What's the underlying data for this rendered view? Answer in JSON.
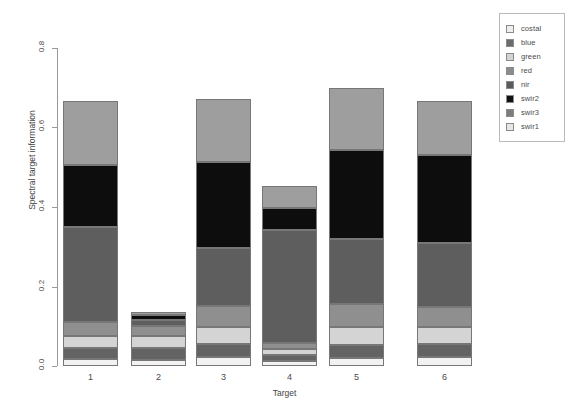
{
  "chart_data": {
    "type": "bar",
    "subtype": "stacked-bar",
    "title": "",
    "xlabel": "Target",
    "ylabel": "Spectral target information",
    "categories": [
      "1",
      "2",
      "3",
      "4",
      "5",
      "6"
    ],
    "xtick_labels": [
      "1",
      "2",
      "3",
      "4",
      "5",
      "6"
    ],
    "ytick_labels": [
      "0.0",
      "0.2",
      "0.4",
      "0.6",
      "0.8"
    ],
    "ytick_values": [
      0.0,
      0.2,
      0.4,
      0.6,
      0.8
    ],
    "ylim": [
      0.0,
      0.87
    ],
    "grid": false,
    "legend_position": "top-right",
    "stack_order_bottom_to_top": [
      "swir1",
      "swir3",
      "swir2",
      "nir",
      "red",
      "green",
      "blue",
      "costal"
    ],
    "series": [
      {
        "name": "swir1",
        "color": "#f2f2f2",
        "values": [
          0.018,
          0.016,
          0.022,
          0.012,
          0.02,
          0.022
        ]
      },
      {
        "name": "swir3",
        "color": "#636363",
        "values": [
          0.028,
          0.03,
          0.034,
          0.014,
          0.033,
          0.034
        ]
      },
      {
        "name": "swir2",
        "color": "#d4d4d4",
        "values": [
          0.03,
          0.032,
          0.044,
          0.016,
          0.046,
          0.042
        ]
      },
      {
        "name": "nir",
        "color": "#8f8f8f",
        "values": [
          0.036,
          0.026,
          0.052,
          0.014,
          0.058,
          0.05
        ]
      },
      {
        "name": "red",
        "color": "#5e5e5e",
        "values": [
          0.24,
          0.016,
          0.145,
          0.285,
          0.163,
          0.162
        ]
      },
      {
        "name": "green",
        "color": "#d9d9d9",
        "values": [
          0.0,
          0.0,
          0.0,
          0.0,
          0.0,
          0.0
        ]
      },
      {
        "name": "blue",
        "color": "#0d0d0d",
        "values": [
          0.157,
          0.011,
          0.216,
          0.056,
          0.223,
          0.22
        ]
      },
      {
        "name": "costal",
        "color": "#9e9e9e",
        "values": [
          0.161,
          0.006,
          0.158,
          0.057,
          0.156,
          0.135
        ]
      }
    ],
    "totals": [
      0.67,
      0.137,
      0.671,
      0.454,
      0.699,
      0.665
    ],
    "bar_totals_note": "Bar 3 total ~0.84, bar 5 ~0.86, bar 6 ~0.84 at top of plotted stack"
  },
  "legend": {
    "items": [
      {
        "label": "costal",
        "color": "#efefef"
      },
      {
        "label": "blue",
        "color": "#6b6b6b"
      },
      {
        "label": "green",
        "color": "#d3d3d3"
      },
      {
        "label": "red",
        "color": "#8c8c8c"
      },
      {
        "label": "nir",
        "color": "#5a5a5a"
      },
      {
        "label": "swir2",
        "color": "#121212"
      },
      {
        "label": "swir3",
        "color": "#7d7d7d"
      },
      {
        "label": "swir1",
        "color": "#e6e6e6"
      }
    ]
  },
  "axes": {
    "y_title": "Spectral target information",
    "x_title": "Target",
    "y_ticks": [
      "0.8",
      "0.6",
      "0.4",
      "0.2",
      "0.0"
    ],
    "x_ticks": [
      "1",
      "2",
      "3",
      "4",
      "5",
      "6"
    ]
  },
  "bars": [
    {
      "category": "1",
      "segments": [
        {
          "name": "swir1",
          "color": "#f2f2f2",
          "top": 359,
          "height": 7
        },
        {
          "name": "swir3",
          "color": "#636363",
          "top": 348,
          "height": 11
        },
        {
          "name": "swir2",
          "color": "#d4d4d4",
          "top": 336,
          "height": 12
        },
        {
          "name": "nir",
          "color": "#8f8f8f",
          "top": 322,
          "height": 14
        },
        {
          "name": "red",
          "color": "#5e5e5e",
          "top": 227,
          "height": 95
        },
        {
          "name": "swir2b",
          "color": "#0d0d0d",
          "top": 165,
          "height": 62
        },
        {
          "name": "costal",
          "color": "#9e9e9e",
          "top": 101,
          "height": 64
        }
      ]
    },
    {
      "category": "2",
      "segments": [
        {
          "name": "swir1",
          "color": "#f2f2f2",
          "top": 360,
          "height": 6
        },
        {
          "name": "swir3",
          "color": "#636363",
          "top": 348,
          "height": 12
        },
        {
          "name": "swir2",
          "color": "#d4d4d4",
          "top": 336,
          "height": 12
        },
        {
          "name": "nir",
          "color": "#8f8f8f",
          "top": 326,
          "height": 10
        },
        {
          "name": "red",
          "color": "#5e5e5e",
          "top": 320,
          "height": 6
        },
        {
          "name": "swir2b",
          "color": "#0d0d0d",
          "top": 315,
          "height": 5
        },
        {
          "name": "costal",
          "color": "#9e9e9e",
          "top": 312,
          "height": 3
        }
      ]
    },
    {
      "category": "3",
      "segments": [
        {
          "name": "swir1",
          "color": "#f2f2f2",
          "top": 357,
          "height": 9
        },
        {
          "name": "swir3",
          "color": "#636363",
          "top": 344,
          "height": 13
        },
        {
          "name": "swir2",
          "color": "#d4d4d4",
          "top": 327,
          "height": 17
        },
        {
          "name": "nir",
          "color": "#8f8f8f",
          "top": 306,
          "height": 21
        },
        {
          "name": "red",
          "color": "#5e5e5e",
          "top": 248,
          "height": 58
        },
        {
          "name": "swir2b",
          "color": "#0d0d0d",
          "top": 162,
          "height": 86
        },
        {
          "name": "costal",
          "color": "#9e9e9e",
          "top": 99,
          "height": 63
        }
      ]
    },
    {
      "category": "4",
      "segments": [
        {
          "name": "swir1",
          "color": "#f2f2f2",
          "top": 361,
          "height": 5
        },
        {
          "name": "swir3",
          "color": "#636363",
          "top": 355,
          "height": 6
        },
        {
          "name": "swir2",
          "color": "#d4d4d4",
          "top": 349,
          "height": 6
        },
        {
          "name": "nir",
          "color": "#8f8f8f",
          "top": 343,
          "height": 6
        },
        {
          "name": "red",
          "color": "#5e5e5e",
          "top": 230,
          "height": 113
        },
        {
          "name": "swir2b",
          "color": "#0d0d0d",
          "top": 208,
          "height": 22
        },
        {
          "name": "costal",
          "color": "#9e9e9e",
          "top": 186,
          "height": 22
        }
      ]
    },
    {
      "category": "5",
      "segments": [
        {
          "name": "swir1",
          "color": "#f2f2f2",
          "top": 358,
          "height": 8
        },
        {
          "name": "swir3",
          "color": "#636363",
          "top": 345,
          "height": 13
        },
        {
          "name": "swir2",
          "color": "#d4d4d4",
          "top": 327,
          "height": 18
        },
        {
          "name": "nir",
          "color": "#8f8f8f",
          "top": 304,
          "height": 23
        },
        {
          "name": "red",
          "color": "#5e5e5e",
          "top": 239,
          "height": 65
        },
        {
          "name": "swir2b",
          "color": "#0d0d0d",
          "top": 150,
          "height": 89
        },
        {
          "name": "costal",
          "color": "#9e9e9e",
          "top": 88,
          "height": 62
        }
      ]
    },
    {
      "category": "6",
      "segments": [
        {
          "name": "swir1",
          "color": "#f2f2f2",
          "top": 357,
          "height": 9
        },
        {
          "name": "swir3",
          "color": "#636363",
          "top": 344,
          "height": 13
        },
        {
          "name": "swir2",
          "color": "#d4d4d4",
          "top": 327,
          "height": 17
        },
        {
          "name": "nir",
          "color": "#8f8f8f",
          "top": 307,
          "height": 20
        },
        {
          "name": "red",
          "color": "#5e5e5e",
          "top": 243,
          "height": 64
        },
        {
          "name": "swir2b",
          "color": "#0d0d0d",
          "top": 155,
          "height": 88
        },
        {
          "name": "costal",
          "color": "#9e9e9e",
          "top": 101,
          "height": 54
        }
      ]
    }
  ],
  "geometry": {
    "bar_lefts": [
      63,
      131,
      196,
      262,
      329,
      417
    ],
    "bar_width": 55,
    "y_tick_tops": [
      48,
      127,
      207,
      287,
      366
    ],
    "x_label_lefts": [
      63,
      131,
      196,
      262,
      329,
      417
    ]
  }
}
